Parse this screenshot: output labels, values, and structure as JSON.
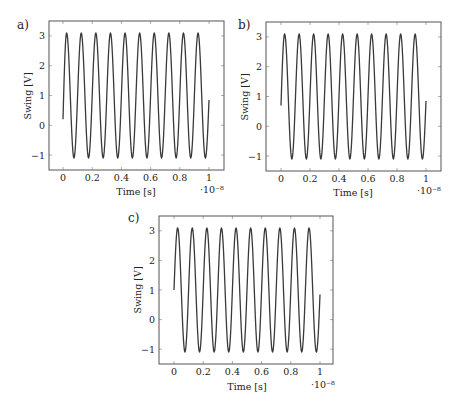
{
  "figure": {
    "panels": [
      {
        "label": "a)",
        "ylabel": "Swing [V]",
        "xlabel": "Time [s]",
        "xexponent": "·10⁻⁸"
      },
      {
        "label": "b)",
        "ylabel": "Swing [V]",
        "xlabel": "Time [s]",
        "xexponent": "·10⁻⁸"
      },
      {
        "label": "c)",
        "ylabel": "Swing [V]",
        "xlabel": "Time [s]",
        "xexponent": "·10⁻⁸"
      }
    ]
  },
  "chart_data": [
    {
      "type": "line",
      "title": "a)",
      "xlabel": "Time [s]",
      "ylabel": "Swing [V]",
      "x_scale_note": "·10⁻⁸",
      "xlim": [
        -0.1,
        1.1
      ],
      "ylim": [
        -1.5,
        3.5
      ],
      "xticks": [
        0,
        0.2,
        0.4,
        0.6,
        0.8,
        1
      ],
      "yticks": [
        -1,
        0,
        1,
        2,
        3
      ],
      "grid": false,
      "series": [
        {
          "name": "swing",
          "description": "sinusoid, ~10 cycles, offset ~1.0 V, amplitude ~2.1 V",
          "points": [
            [
              0,
              0.2
            ],
            [
              0.025,
              3.1
            ],
            [
              0.075,
              -1.1
            ],
            [
              0.125,
              3.1
            ],
            [
              0.175,
              -1.1
            ],
            [
              0.225,
              3.1
            ],
            [
              0.275,
              -1.1
            ],
            [
              0.325,
              3.1
            ],
            [
              0.375,
              -1.1
            ],
            [
              0.425,
              3.1
            ],
            [
              0.475,
              -1.1
            ],
            [
              0.525,
              3.1
            ],
            [
              0.575,
              -1.1
            ],
            [
              0.625,
              3.1
            ],
            [
              0.675,
              -1.1
            ],
            [
              0.725,
              3.1
            ],
            [
              0.775,
              -1.1
            ],
            [
              0.825,
              3.1
            ],
            [
              0.875,
              -1.1
            ],
            [
              0.925,
              3.1
            ],
            [
              0.975,
              -1.1
            ],
            [
              1.0,
              0.85
            ]
          ]
        }
      ]
    },
    {
      "type": "line",
      "title": "b)",
      "xlabel": "Time [s]",
      "ylabel": "Swing [V]",
      "x_scale_note": "·10⁻⁸",
      "xlim": [
        -0.1,
        1.1
      ],
      "ylim": [
        -1.5,
        3.5
      ],
      "xticks": [
        0,
        0.2,
        0.4,
        0.6,
        0.8,
        1
      ],
      "yticks": [
        -1,
        0,
        1,
        2,
        3
      ],
      "grid": false,
      "series": [
        {
          "name": "swing",
          "description": "sinusoid, ~10 cycles, offset ~1.0 V, amplitude ~2.1 V",
          "points": [
            [
              0,
              0.7
            ],
            [
              0.025,
              3.1
            ],
            [
              0.075,
              -1.1
            ],
            [
              0.125,
              3.1
            ],
            [
              0.175,
              -1.1
            ],
            [
              0.225,
              3.1
            ],
            [
              0.275,
              -1.1
            ],
            [
              0.325,
              3.1
            ],
            [
              0.375,
              -1.1
            ],
            [
              0.425,
              3.1
            ],
            [
              0.475,
              -1.1
            ],
            [
              0.525,
              3.1
            ],
            [
              0.575,
              -1.1
            ],
            [
              0.625,
              3.1
            ],
            [
              0.675,
              -1.1
            ],
            [
              0.725,
              3.1
            ],
            [
              0.775,
              -1.1
            ],
            [
              0.825,
              3.1
            ],
            [
              0.875,
              -1.1
            ],
            [
              0.925,
              3.1
            ],
            [
              0.975,
              -1.1
            ],
            [
              1.0,
              0.85
            ]
          ]
        }
      ]
    },
    {
      "type": "line",
      "title": "c)",
      "xlabel": "Time [s]",
      "ylabel": "Swing [V]",
      "x_scale_note": "·10⁻⁸",
      "xlim": [
        -0.1,
        1.1
      ],
      "ylim": [
        -1.5,
        3.5
      ],
      "xticks": [
        0,
        0.2,
        0.4,
        0.6,
        0.8,
        1
      ],
      "yticks": [
        -1,
        0,
        1,
        2,
        3
      ],
      "grid": false,
      "series": [
        {
          "name": "swing",
          "description": "sinusoid, ~10 cycles, offset ~1.0 V, amplitude ~2.1 V",
          "points": [
            [
              0,
              1.0
            ],
            [
              0.025,
              3.1
            ],
            [
              0.075,
              -1.1
            ],
            [
              0.125,
              3.1
            ],
            [
              0.175,
              -1.1
            ],
            [
              0.225,
              3.1
            ],
            [
              0.275,
              -1.1
            ],
            [
              0.325,
              3.1
            ],
            [
              0.375,
              -1.1
            ],
            [
              0.425,
              3.1
            ],
            [
              0.475,
              -1.1
            ],
            [
              0.525,
              3.1
            ],
            [
              0.575,
              -1.1
            ],
            [
              0.625,
              3.1
            ],
            [
              0.675,
              -1.1
            ],
            [
              0.725,
              3.1
            ],
            [
              0.775,
              -1.1
            ],
            [
              0.825,
              3.1
            ],
            [
              0.875,
              -1.1
            ],
            [
              0.925,
              3.1
            ],
            [
              0.975,
              -1.1
            ],
            [
              1.0,
              0.85
            ]
          ]
        }
      ]
    }
  ]
}
